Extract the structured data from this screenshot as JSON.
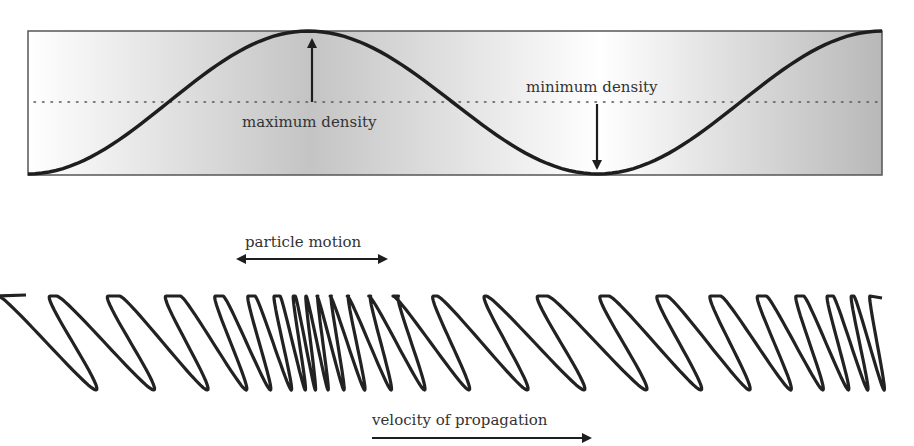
{
  "figure": {
    "top_panel": {
      "label_max": "maximum density",
      "label_min": "minimum density",
      "box": {
        "x": 28,
        "y": 31,
        "width": 854,
        "height": 144
      },
      "midline_y": 102,
      "wave": {
        "start_x": 28,
        "peak_x": 308,
        "trough_x": 598,
        "end_x": 882,
        "top_y": 31,
        "bottom_y": 174
      },
      "colors": {
        "curve": "#1e1e1e",
        "shade_dark": "#b8b8b8",
        "shade_light": "#ffffff",
        "frame": "#555555"
      }
    },
    "bottom_panel": {
      "label_motion": "particle motion",
      "label_velocity": "velocity of propagation",
      "coil_loop_centers": [
        60,
        118,
        175,
        222,
        253,
        278,
        296,
        308,
        320,
        334,
        352,
        375,
        404,
        441,
        494,
        548,
        610,
        667,
        719,
        765,
        802,
        832,
        855,
        873
      ],
      "coil_top_y": 296,
      "coil_bottom_y": 390
    }
  }
}
